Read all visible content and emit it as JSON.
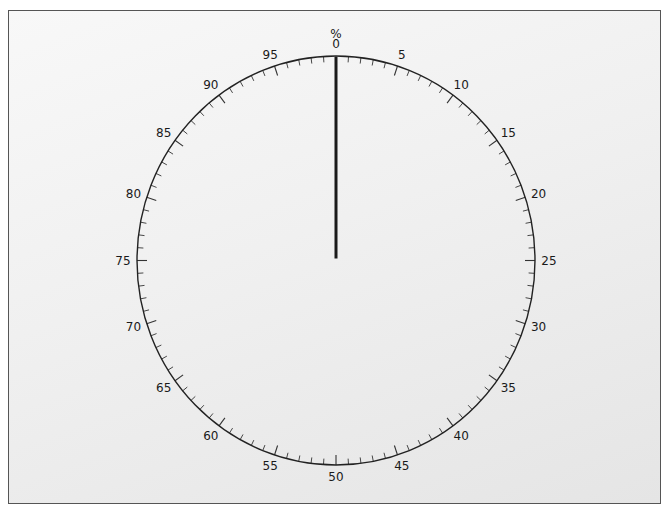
{
  "chart_data": {
    "type": "gauge",
    "title": "",
    "unit_label": "%",
    "min": 0,
    "max": 100,
    "value": 0,
    "major_tick_step": 5,
    "minor_tick_step": 1,
    "tick_labels": [
      "0",
      "5",
      "10",
      "15",
      "20",
      "25",
      "30",
      "35",
      "40",
      "45",
      "50",
      "55",
      "60",
      "65",
      "70",
      "75",
      "80",
      "85",
      "90",
      "95"
    ],
    "needle_color": "#1a1a1a",
    "dial_line_color": "#222222",
    "direction": "clockwise",
    "zero_position": "top"
  },
  "gauge": {
    "unit": "%",
    "value": 0
  }
}
